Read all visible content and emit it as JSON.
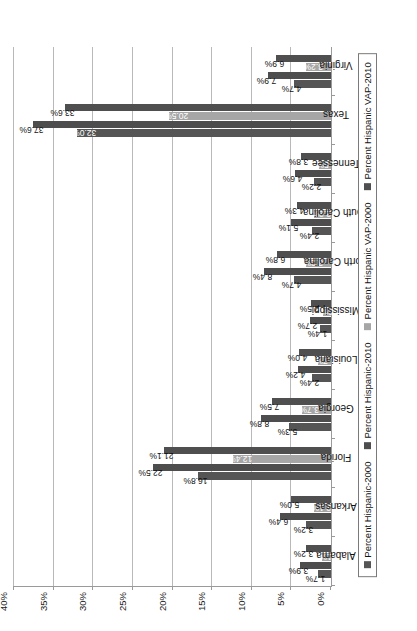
{
  "chart_data": {
    "type": "bar",
    "title": "",
    "xlabel": "",
    "ylabel": "",
    "ylim": [
      0,
      0.4
    ],
    "grid": true,
    "legend_position": "bottom",
    "orientation": "rotated-90",
    "ytick_labels": [
      "0%",
      "5%",
      "10%",
      "15%",
      "20%",
      "25%",
      "30%",
      "35%",
      "40%"
    ],
    "ytick_values": [
      0,
      5,
      10,
      15,
      20,
      25,
      30,
      35,
      40
    ],
    "categories": [
      "Alabama",
      "Arkansas",
      "Florida",
      "Georgia",
      "Louisiana",
      "Mississippi",
      "North Carolina",
      "South Carolina",
      "Tennessee",
      "Texas",
      "Virginia"
    ],
    "series": [
      {
        "name": "Percent Hispanic-2000",
        "color": "#555555",
        "values": [
          1.7,
          3.2,
          16.8,
          5.3,
          2.4,
          1.4,
          4.7,
          2.4,
          2.2,
          32.0,
          4.7
        ],
        "labels": [
          "1.7%",
          "3.2%",
          "16.8%",
          "5.3%",
          "2.4%",
          "1.4%",
          "4.7%",
          "2.4%",
          "2.2%",
          "32.0%",
          "4.7%"
        ],
        "label_inside": [
          false,
          false,
          false,
          false,
          false,
          false,
          false,
          false,
          false,
          true,
          false
        ]
      },
      {
        "name": "Percent Hispanic-2010",
        "color": "#4d4d4d",
        "values": [
          3.9,
          6.4,
          22.5,
          8.8,
          4.2,
          2.7,
          8.4,
          5.1,
          4.6,
          37.6,
          7.9
        ],
        "labels": [
          "3.9%",
          "6.4%",
          "22.5%",
          "8.8%",
          "4.2%",
          "2.7%",
          "8.4%",
          "5.1%",
          "4.6%",
          "37.6%",
          "7.9%"
        ],
        "label_inside": [
          false,
          false,
          false,
          false,
          false,
          false,
          false,
          false,
          false,
          false,
          false
        ]
      },
      {
        "name": "Percent Hispanic VAP-2000",
        "color": "#a6a6a6",
        "values": [
          1.1,
          2.1,
          12.4,
          3.7,
          1.7,
          1.0,
          3.2,
          2.2,
          1.5,
          20.5,
          3.2
        ],
        "labels": [
          "1.1%",
          "2.1%",
          "12.4%",
          "3.7%",
          "1.7%",
          "1.0%",
          "3.2%",
          "2.2%",
          "1.5%",
          "20.5%",
          "3.2%"
        ],
        "label_inside": [
          true,
          true,
          true,
          true,
          true,
          true,
          true,
          true,
          true,
          true,
          true
        ]
      },
      {
        "name": "Percent Hispanic VAP-2010",
        "color": "#4f4f4f",
        "values": [
          3.2,
          5.0,
          21.1,
          7.5,
          4.0,
          2.5,
          6.8,
          4.3,
          3.8,
          33.6,
          6.9
        ],
        "labels": [
          "3.2%",
          "5.0%",
          "21.1%",
          "7.5%",
          "4.0%",
          "2.5%",
          "6.8%",
          "4.3%",
          "3.8%",
          "33.6%",
          "6.9%"
        ],
        "label_inside": [
          false,
          false,
          false,
          false,
          false,
          false,
          false,
          false,
          false,
          false,
          false
        ]
      }
    ]
  }
}
